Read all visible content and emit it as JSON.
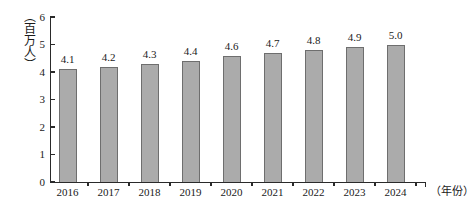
{
  "chart_data": {
    "type": "bar",
    "title": "",
    "subtitle": "",
    "xlabel": "（年份）",
    "ylabel": "（百万人）",
    "categories": [
      "2016",
      "2017",
      "2018",
      "2019",
      "2020",
      "2021",
      "2022",
      "2023",
      "2024"
    ],
    "values": [
      4.1,
      4.2,
      4.3,
      4.4,
      4.6,
      4.7,
      4.8,
      4.9,
      5.0
    ],
    "value_labels": [
      "4.1",
      "4.2",
      "4.3",
      "4.4",
      "4.6",
      "4.7",
      "4.8",
      "4.9",
      "5.0"
    ],
    "ylim": [
      0,
      6
    ],
    "ytick_labels": [
      "0",
      "1",
      "2",
      "3",
      "4",
      "5",
      "6"
    ],
    "ytick_values": [
      0,
      1,
      2,
      3,
      4,
      5,
      6
    ],
    "grid": false,
    "legend": null,
    "series": [
      {
        "name": "",
        "values": [
          4.1,
          4.2,
          4.3,
          4.4,
          4.6,
          4.7,
          4.8,
          4.9,
          5.0
        ]
      }
    ],
    "colors": {
      "bar_fill": "#ababab",
      "bar_border": "#6e6e6e",
      "axis": "#2a2a2a",
      "text": "#1a1a1a",
      "background": "#ffffff"
    }
  }
}
